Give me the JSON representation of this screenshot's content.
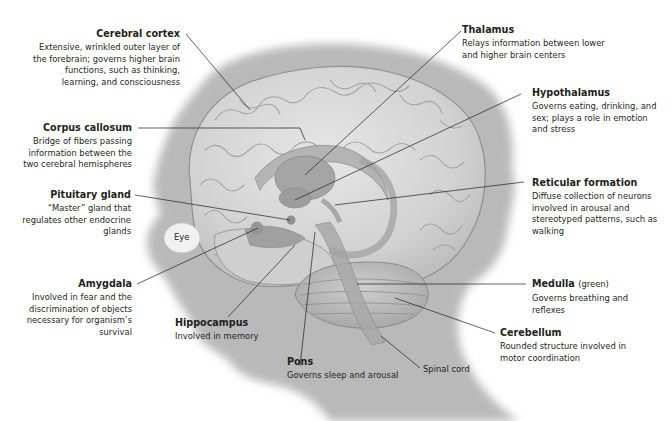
{
  "figure": {
    "header_fragment": "",
    "structures": [
      {
        "id": "cerebral-cortex",
        "name": "Cerebral cortex",
        "note": "",
        "description": "Extensive, wrinkled outer layer of the forebrain; governs higher brain functions, such as thinking, learning, and consciousness",
        "side": "left"
      },
      {
        "id": "corpus-callosum",
        "name": "Corpus callosum",
        "note": "",
        "description": "Bridge of fibers passing information between the two cerebral hemispheres",
        "side": "left"
      },
      {
        "id": "pituitary-gland",
        "name": "Pituitary gland",
        "note": "",
        "description": "“Master” gland that regulates other endocrine glands",
        "side": "left"
      },
      {
        "id": "amygdala",
        "name": "Amygdala",
        "note": "",
        "description": "Involved in fear and the discrimination of objects necessary for organism’s survival",
        "side": "left"
      },
      {
        "id": "hippocampus",
        "name": "Hippocampus",
        "note": "",
        "description": "Involved in memory",
        "side": "bottom"
      },
      {
        "id": "pons",
        "name": "Pons",
        "note": "",
        "description": "Governs sleep and arousal",
        "side": "bottom"
      },
      {
        "id": "thalamus",
        "name": "Thalamus",
        "note": "",
        "description": "Relays information between lower and higher brain centers",
        "side": "right"
      },
      {
        "id": "hypothalamus",
        "name": "Hypothalamus",
        "note": "",
        "description": "Governs eating, drinking, and sex; plays a role in emotion and stress",
        "side": "right"
      },
      {
        "id": "reticular-formation",
        "name": "Reticular formation",
        "note": "",
        "description": "Diffuse collection of neurons involved in arousal and stereotyped patterns, such as walking",
        "side": "right"
      },
      {
        "id": "medulla",
        "name": "Medulla",
        "note": "(green)",
        "description": "Governs breathing and reflexes",
        "side": "right"
      },
      {
        "id": "cerebellum",
        "name": "Cerebellum",
        "note": "",
        "description": "Rounded structure involved in motor coordination",
        "side": "right"
      }
    ],
    "plain_labels": {
      "eye": "Eye",
      "spinal_cord": "Spinal cord"
    },
    "colors": {
      "background": "#ffffff",
      "head_silhouette": "#b9b9b9",
      "brain_fill": "#d8d8d8",
      "brain_outline": "#8f8f8f",
      "inner_structures": "#a9a9a9",
      "leader_lines": "#231f20",
      "text": "#231f20"
    }
  }
}
